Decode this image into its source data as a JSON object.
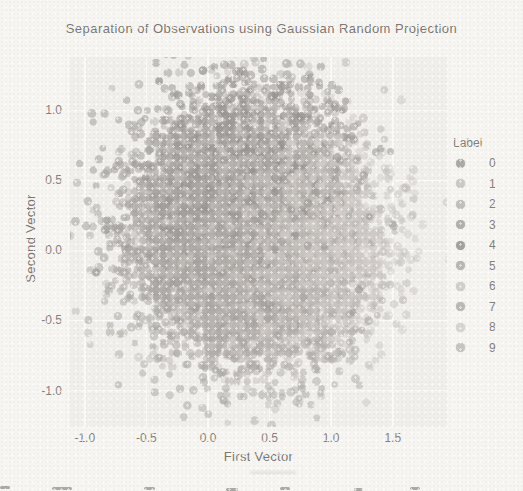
{
  "chart_data": {
    "type": "scatter",
    "title": "Separation of Observations using Gaussian Random Projection",
    "xlabel": "First Vector",
    "ylabel": "Second Vector",
    "xlim": [
      -1.12,
      1.94
    ],
    "ylim": [
      -1.26,
      1.38
    ],
    "grid": true,
    "xticks": {
      "values": [
        -1.0,
        -0.5,
        0.0,
        0.5,
        1.0,
        1.5
      ],
      "labels": [
        "-1.0",
        "-0.5",
        "0.0",
        "0.5",
        "1.0",
        "1.5"
      ]
    },
    "yticks": {
      "values": [
        1.0,
        0.5,
        0.0,
        -0.5,
        -1.0
      ],
      "labels": [
        "1.0",
        "0.5",
        "0.0",
        "-0.5",
        "-1.0"
      ]
    },
    "legend": {
      "title": "Label",
      "position": "right",
      "entries": [
        "0",
        "1",
        "2",
        "3",
        "4",
        "5",
        "6",
        "7",
        "8",
        "9"
      ]
    },
    "series": [
      {
        "name": "0",
        "color": "#a09c99",
        "center": [
          0.04,
          0.35
        ],
        "std": [
          0.4,
          0.36
        ],
        "n": 1000
      },
      {
        "name": "1",
        "color": "#c7c3bf",
        "center": [
          0.59,
          0.0
        ],
        "std": [
          0.4,
          0.36
        ],
        "n": 1000
      },
      {
        "name": "2",
        "color": "#bab6b2",
        "center": [
          0.39,
          0.4
        ],
        "std": [
          0.4,
          0.36
        ],
        "n": 1000
      },
      {
        "name": "3",
        "color": "#a9a5a1",
        "center": [
          0.19,
          -0.1
        ],
        "std": [
          0.4,
          0.36
        ],
        "n": 1000
      },
      {
        "name": "4",
        "color": "#97938f",
        "center": [
          0.39,
          0.55
        ],
        "std": [
          0.38,
          0.38
        ],
        "n": 1000
      },
      {
        "name": "5",
        "color": "#b1ada9",
        "center": [
          0.09,
          0.05
        ],
        "std": [
          0.4,
          0.36
        ],
        "n": 1000
      },
      {
        "name": "6",
        "color": "#cdc9c5",
        "center": [
          0.64,
          0.1
        ],
        "std": [
          0.4,
          0.36
        ],
        "n": 1000
      },
      {
        "name": "7",
        "color": "#b3afab",
        "center": [
          0.44,
          -0.25
        ],
        "std": [
          0.4,
          0.36
        ],
        "n": 1000
      },
      {
        "name": "8",
        "color": "#d4d0cc",
        "center": [
          0.69,
          0.05
        ],
        "std": [
          0.4,
          0.34
        ],
        "n": 1000
      },
      {
        "name": "9",
        "color": "#c1bdb9",
        "center": [
          0.29,
          0.15
        ],
        "std": [
          0.4,
          0.36
        ],
        "n": 1000
      }
    ],
    "render": {
      "seed": 20,
      "points_per_label": 1000,
      "point_radius_px": 4.0,
      "point_alpha": 0.52
    },
    "colors": {
      "paper": "#f7f5f2",
      "plot_background": "#f1efec",
      "gridline": "#fbfaf8",
      "text": "#7c7874"
    }
  }
}
